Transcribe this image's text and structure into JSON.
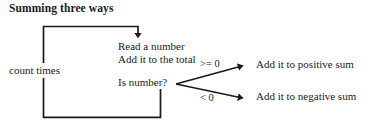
{
  "diagram": {
    "title": "Summing three ways",
    "loop": {
      "label": "count times"
    },
    "process": {
      "line1": "Read a number",
      "line2": "Add it to the total"
    },
    "decision": {
      "label": "Is number?",
      "branches": [
        {
          "condition": ">= 0",
          "outcome": "Add it to positive sum"
        },
        {
          "condition": "< 0",
          "outcome": "Add it to negative sum"
        }
      ]
    },
    "style": {
      "line_color": "#1a1a1a",
      "text_color": "#1a1a1a",
      "background": "#ffffff"
    }
  }
}
